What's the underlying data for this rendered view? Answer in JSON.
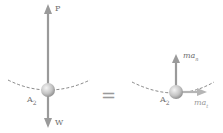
{
  "diagram": {
    "left": {
      "force_up_label": "P",
      "force_down_label": "W",
      "point_label": "A",
      "point_sub": "2"
    },
    "equals": "=",
    "right": {
      "normal_label": "ma",
      "normal_sub": "n",
      "tangent_label": "ma",
      "tangent_sub": "t",
      "point_label": "A",
      "point_sub": "2"
    },
    "colors": {
      "arrow": "#9a9a9a",
      "path": "#555555",
      "ball_light": "#f2f2f2",
      "ball_dark": "#8c8c8c",
      "label": "#6f6f6f"
    }
  }
}
